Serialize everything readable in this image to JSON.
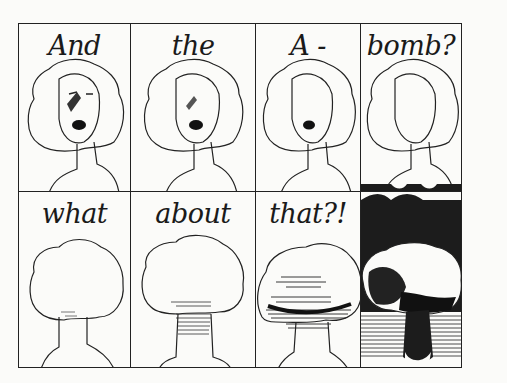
{
  "comic": {
    "panels": [
      {
        "row": 1,
        "col": 1,
        "caption": "And",
        "subject": "woman-face",
        "detail": "eyes, nose, open mouth, bruise"
      },
      {
        "row": 1,
        "col": 2,
        "caption": "the",
        "subject": "woman-face",
        "detail": "nose, open mouth, bruise; eyes gone"
      },
      {
        "row": 1,
        "col": 3,
        "caption": "A -",
        "subject": "woman-face",
        "detail": "mouth only"
      },
      {
        "row": 1,
        "col": 4,
        "caption": "bomb?",
        "subject": "woman-face",
        "detail": "blank face"
      },
      {
        "row": 2,
        "col": 1,
        "caption": "what",
        "subject": "mushroom-cloud",
        "detail": "outline"
      },
      {
        "row": 2,
        "col": 2,
        "caption": "about",
        "subject": "mushroom-cloud",
        "detail": "light hatching"
      },
      {
        "row": 2,
        "col": 3,
        "caption": "that?!",
        "subject": "mushroom-cloud",
        "detail": "heavy hatching"
      },
      {
        "row": 2,
        "col": 4,
        "caption": "",
        "subject": "mushroom-cloud",
        "detail": "black background, dark explosion"
      }
    ],
    "colors": {
      "ink": "#1c1c1c",
      "paper": "#fbfbf9"
    }
  }
}
